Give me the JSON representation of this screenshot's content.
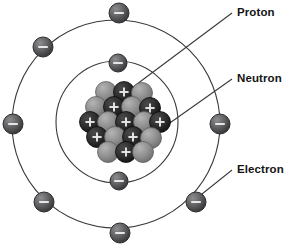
{
  "diagram": {
    "background_color": "#ffffff",
    "labels": {
      "proton": "Proton",
      "neutron": "Neutron",
      "electron": "Electron"
    },
    "colors": {
      "proton": "#2b2b2b",
      "neutron": "#8c8c8c",
      "electron": "#58585a",
      "orbit": "#3a3a3a",
      "leader_line": "#3a3a3a",
      "text": "#141414"
    },
    "symbols": {
      "proton_charge": "+",
      "neutron_charge": "",
      "electron_charge": "−"
    },
    "icon_names": {
      "proton": "proton-particle-icon",
      "neutron": "neutron-particle-icon",
      "electron": "electron-particle-icon"
    }
  },
  "chart_data": {
    "type": "scatter",
    "xlabel": "",
    "ylabel": "",
    "xlim": [
      0,
      303
    ],
    "ylim": [
      0,
      248
    ],
    "grid": false,
    "legend": [
      "Proton",
      "Neutron",
      "Electron"
    ],
    "orbits": [
      {
        "name": "inner-shell",
        "cx": 117,
        "cy": 122,
        "r": 61,
        "electron_count": 4
      },
      {
        "name": "outer-shell",
        "cx": 116,
        "cy": 124,
        "r": 104,
        "electron_count": 8
      }
    ],
    "electrons": [
      {
        "id": "e1",
        "shell": "outer",
        "x": 119,
        "y": 13,
        "r": 10
      },
      {
        "id": "e2",
        "shell": "outer",
        "x": 43,
        "y": 47,
        "r": 10
      },
      {
        "id": "e3",
        "shell": "outer",
        "x": 13,
        "y": 124,
        "r": 10
      },
      {
        "id": "e4",
        "shell": "outer",
        "x": 44,
        "y": 202,
        "r": 10
      },
      {
        "id": "e5",
        "shell": "outer",
        "x": 120,
        "y": 233,
        "r": 10
      },
      {
        "id": "e6",
        "shell": "outer",
        "x": 196,
        "y": 202,
        "r": 10
      },
      {
        "id": "e7",
        "shell": "outer",
        "x": 220,
        "y": 124,
        "r": 10
      },
      {
        "id": "e8",
        "shell": "inner",
        "x": 118,
        "y": 63,
        "r": 9
      },
      {
        "id": "e9",
        "shell": "inner",
        "x": 119,
        "y": 181,
        "r": 9
      }
    ],
    "nucleus": {
      "center": [
        124,
        122
      ],
      "particle_radius": 10.5,
      "particles": [
        {
          "type": "neutron",
          "x": 106,
          "y": 92
        },
        {
          "type": "proton",
          "x": 124,
          "y": 92
        },
        {
          "type": "neutron",
          "x": 142,
          "y": 93
        },
        {
          "type": "neutron",
          "x": 96,
          "y": 107
        },
        {
          "type": "proton",
          "x": 114,
          "y": 107
        },
        {
          "type": "neutron",
          "x": 132,
          "y": 107
        },
        {
          "type": "proton",
          "x": 150,
          "y": 108
        },
        {
          "type": "proton",
          "x": 90,
          "y": 122
        },
        {
          "type": "neutron",
          "x": 108,
          "y": 122
        },
        {
          "type": "proton",
          "x": 126,
          "y": 122
        },
        {
          "type": "neutron",
          "x": 144,
          "y": 122
        },
        {
          "type": "proton",
          "x": 160,
          "y": 122
        },
        {
          "type": "proton",
          "x": 97,
          "y": 137
        },
        {
          "type": "neutron",
          "x": 115,
          "y": 137
        },
        {
          "type": "proton",
          "x": 133,
          "y": 137
        },
        {
          "type": "neutron",
          "x": 151,
          "y": 138
        },
        {
          "type": "neutron",
          "x": 108,
          "y": 152
        },
        {
          "type": "proton",
          "x": 126,
          "y": 152
        },
        {
          "type": "neutron",
          "x": 143,
          "y": 152
        }
      ]
    },
    "leader_lines": [
      {
        "label": "Proton",
        "from": [
          232,
          13
        ],
        "to": [
          125,
          93
        ]
      },
      {
        "label": "Neutron",
        "from": [
          232,
          79
        ],
        "to": [
          150,
          137
        ]
      },
      {
        "label": "Electron",
        "from": [
          232,
          170
        ],
        "to": [
          192,
          202
        ]
      }
    ]
  }
}
